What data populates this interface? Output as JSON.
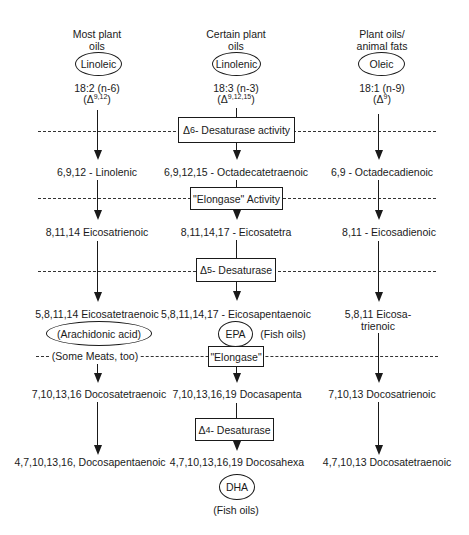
{
  "columns": [
    {
      "source_line1": "Most plant",
      "source_line2": "oils",
      "precursor": "Linoleic",
      "formula": "18:2 (n-6)",
      "delta_prefix": "(Δ",
      "delta_sup": "9,12",
      "delta_suffix": ")",
      "step1": "6,9,12 - Linolenic",
      "step2": "8,11,14 Eicosatrienoic",
      "step3": "5,8,11,14 Eicosatetraenoic",
      "step3_common_name": "(Arachidonic acid)",
      "step3_note": "(Some Meats, too)",
      "step4": "7,10,13,16 Docosatetraenoic",
      "step5": "4,7,10,13,16, Docosapentaenoic"
    },
    {
      "source_line1": "Certain plant",
      "source_line2": "oils",
      "precursor": "Linolenic",
      "formula": "18:3 (n-3)",
      "delta_prefix": "(Δ",
      "delta_sup": "9,12,15",
      "delta_suffix": ")",
      "step1": "6,9,12,15 - Octadecatetraenoic",
      "step2": "8,11,14,17 - Eicosatetra",
      "step3": "5,8,11,14,17 - Eicosapentaenoic",
      "step3_common_name": "EPA",
      "step3_note": "(Fish oils)",
      "step4": "7,10,13,16,19 Docasapenta",
      "step5": "4,7,10,13,16,19 Docosahexa",
      "step5_common_name": "DHA",
      "step5_note": "(Fish oils)"
    },
    {
      "source_line1": "Plant oils/",
      "source_line2": "animal fats",
      "precursor": "Oleic",
      "formula": "18:1 (n-9)",
      "delta_prefix": "(Δ",
      "delta_sup": "9",
      "delta_suffix": ")",
      "step1": "6,9 - Octadecadienoic",
      "step2": "8,11 - Eicosadienoic",
      "step3_line1": "5,8,11 Eicosa-",
      "step3_line2": "trienoic",
      "step4": "7,10,13 Docosatrienoic",
      "step5": "4,7,10,13 Docosatetraenoic"
    }
  ],
  "enzymes": [
    {
      "delta": "Δ",
      "sup": "6",
      "label": " - Desaturase activity"
    },
    {
      "label": "\"Elongase\" Activity"
    },
    {
      "delta": "Δ",
      "sup": "5",
      "label": " - Desaturase"
    },
    {
      "label": "\"Elongase\""
    },
    {
      "delta": "Δ",
      "sup": "4",
      "label": " - Desaturase"
    }
  ]
}
